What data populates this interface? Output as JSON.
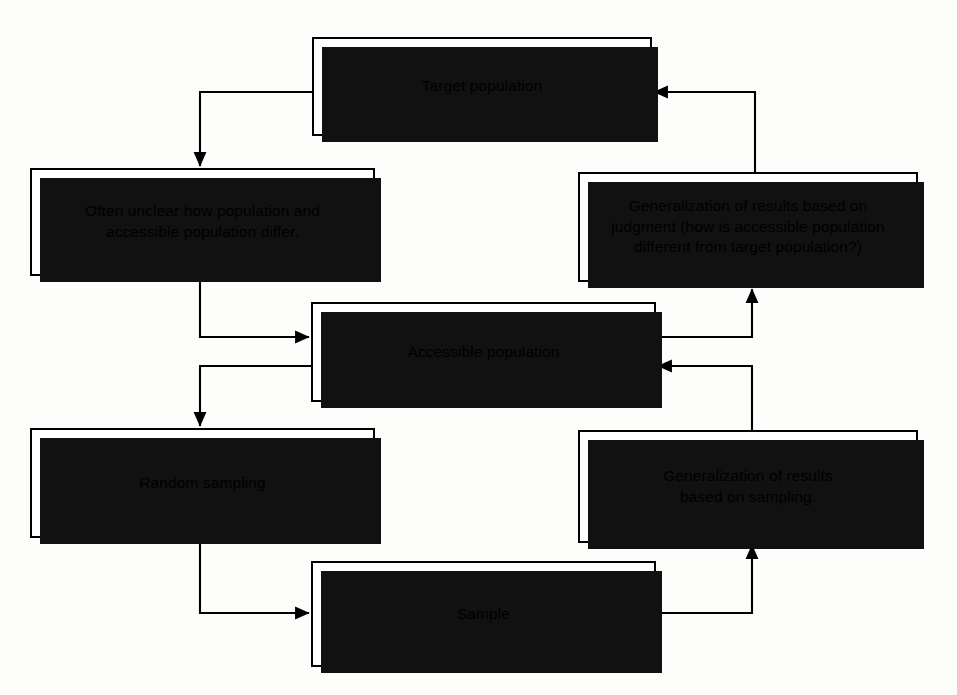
{
  "diagram": {
    "type": "flowchart",
    "ink_color": "#000000",
    "shadow_color": "#111111",
    "background_color": "#ffffff",
    "nodes": [
      {
        "id": "target",
        "label": "Target population"
      },
      {
        "id": "often_unclear",
        "label": "Often unclear how population and\naccessible population differ."
      },
      {
        "id": "generalization_judgment",
        "label": "Generalization of results based on\njudgment (how is accessible population\ndifferent from target population?)"
      },
      {
        "id": "accessible",
        "label": "Accessible population"
      },
      {
        "id": "random_sampling",
        "label": "Random sampling"
      },
      {
        "id": "generalization_sampling",
        "label": "Generalization of results\nbased on sampling."
      },
      {
        "id": "sample",
        "label": "Sample"
      }
    ],
    "connectors": [
      {
        "id": "target-to-often-unclear",
        "from": "target",
        "to": "often_unclear",
        "arrow": "down"
      },
      {
        "id": "often-unclear-to-accessible",
        "from": "often_unclear",
        "to": "accessible",
        "arrow": "right"
      },
      {
        "id": "accessible-to-random-sampling",
        "from": "accessible",
        "to": "random_sampling",
        "arrow": "down"
      },
      {
        "id": "random-sampling-to-sample",
        "from": "random_sampling",
        "to": "sample",
        "arrow": "right"
      },
      {
        "id": "sample-to-generalization-sampling",
        "from": "sample",
        "to": "generalization_sampling",
        "arrow": "up"
      },
      {
        "id": "generalization-sampling-to-accessible",
        "from": "generalization_sampling",
        "to": "accessible",
        "arrow": "left"
      },
      {
        "id": "accessible-to-generalization-judgment",
        "from": "accessible",
        "to": "generalization_judgment",
        "arrow": "up"
      },
      {
        "id": "generalization-judgment-to-target",
        "from": "generalization_judgment",
        "to": "target",
        "arrow": "left"
      }
    ]
  }
}
